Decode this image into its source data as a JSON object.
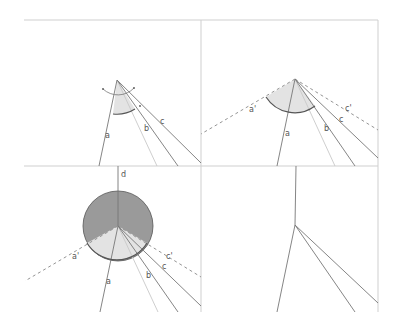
{
  "figure": {
    "panels": [
      {
        "id": "top-left",
        "labels": {
          "a": "a",
          "b": "b",
          "c": "c"
        }
      },
      {
        "id": "top-right",
        "labels": {
          "a": "a",
          "b": "b",
          "c": "c",
          "a_prime": "a'",
          "c_prime": "c'"
        }
      },
      {
        "id": "bottom-left",
        "labels": {
          "a": "a",
          "b": "b",
          "c": "c",
          "d": "d",
          "a_prime": "a'",
          "c_prime": "c'"
        }
      },
      {
        "id": "bottom-right",
        "labels": {}
      }
    ],
    "colors": {
      "frame": "#cfcfcf",
      "ray": "#777777",
      "sector_light": "#e3e3e3",
      "sector_dark": "#9a9a9a"
    }
  }
}
